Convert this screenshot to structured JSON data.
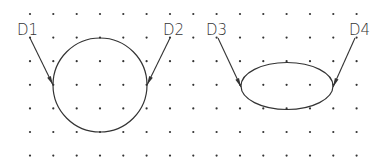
{
  "diagram": {
    "background": "#ffffff",
    "line_color": "#333333",
    "dot_color": "#333333",
    "grid": {
      "x0": 30,
      "y0": 14,
      "dx": 23.33,
      "dy": 23.6,
      "cols": 15,
      "rows": 7
    },
    "shapes": [
      {
        "type": "circle",
        "name": "circle",
        "cx": 100,
        "cy": 85,
        "r": 47
      },
      {
        "type": "ellipse",
        "name": "ellipse",
        "cx": 287,
        "cy": 86,
        "rx": 46,
        "ry": 23.5
      }
    ],
    "leaders": [
      {
        "label": "D1",
        "x1": 30,
        "y1": 38,
        "x2": 53,
        "y2": 85,
        "lx": 17,
        "ly": 35
      },
      {
        "label": "D2",
        "x1": 170,
        "y1": 38,
        "x2": 147,
        "y2": 85,
        "lx": 163,
        "ly": 35
      },
      {
        "label": "D3",
        "x1": 218,
        "y1": 38,
        "x2": 241,
        "y2": 87,
        "lx": 206,
        "ly": 35
      },
      {
        "label": "D4",
        "x1": 355,
        "y1": 38,
        "x2": 333,
        "y2": 87,
        "lx": 349,
        "ly": 35
      }
    ]
  }
}
